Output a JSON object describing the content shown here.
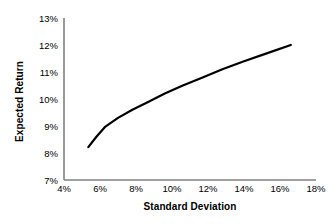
{
  "chart_data": {
    "type": "line",
    "title": "",
    "xlabel": "Standard Deviation",
    "ylabel": "Expected Return",
    "xlim": [
      4,
      18
    ],
    "ylim": [
      7,
      13
    ],
    "xticks": [
      "4%",
      "6%",
      "8%",
      "10%",
      "12%",
      "14%",
      "16%",
      "18%"
    ],
    "xtick_values": [
      4,
      6,
      8,
      10,
      12,
      14,
      16,
      18
    ],
    "yticks": [
      "7%",
      "8%",
      "9%",
      "10%",
      "11%",
      "12%",
      "13%"
    ],
    "ytick_values": [
      7,
      8,
      9,
      10,
      11,
      12,
      13
    ],
    "grid": false,
    "legend": null,
    "series": [
      {
        "name": "Efficient Frontier",
        "color": "#000000",
        "line_width": 2.2,
        "x": [
          5.35,
          5.8,
          6.3,
          7.0,
          7.8,
          8.7,
          9.6,
          10.6,
          11.7,
          12.8,
          14.0,
          15.3,
          16.6
        ],
        "y": [
          8.22,
          8.6,
          8.98,
          9.3,
          9.6,
          9.9,
          10.2,
          10.5,
          10.8,
          11.1,
          11.4,
          11.7,
          12.0
        ]
      }
    ],
    "annotations": []
  },
  "axes": {
    "axis_color": "#808080",
    "tick_label_color": "#000000",
    "background": "#ffffff"
  }
}
